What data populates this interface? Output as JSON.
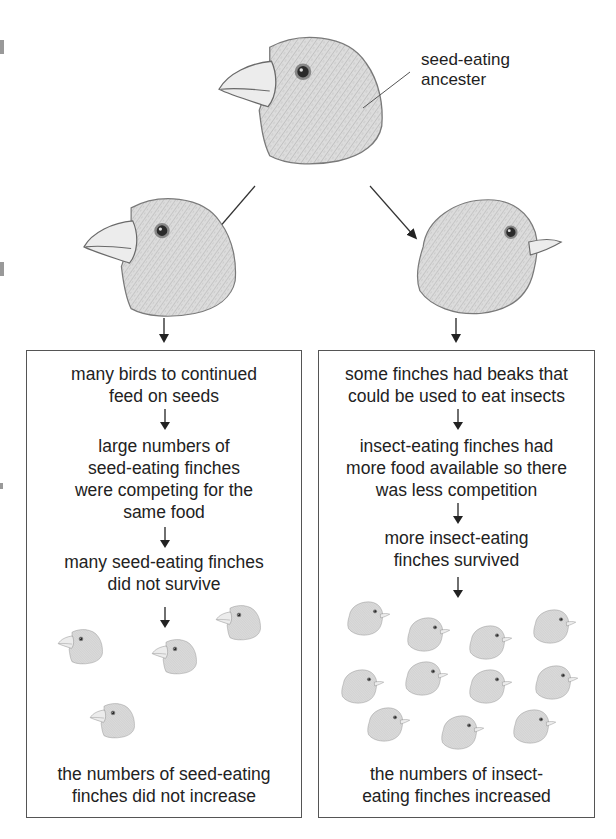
{
  "diagram": {
    "title_label": {
      "line1": "seed-eating",
      "line2": "ancester"
    },
    "ancestor": {
      "name": "seed-eating-ancestor",
      "beak": "thick"
    },
    "branches": [
      {
        "name": "seed-eating-branch",
        "beak": "thick",
        "steps": [
          {
            "lines": [
              "many birds to continued",
              "feed on seeds"
            ]
          },
          {
            "lines": [
              "large numbers of",
              "seed-eating finches",
              "were competing for the",
              "same food"
            ]
          },
          {
            "lines": [
              "many seed-eating finches",
              "did not survive"
            ]
          }
        ],
        "population_count": 4,
        "outcome": {
          "lines": [
            "the numbers of seed-eating",
            "finches did not increase"
          ]
        }
      },
      {
        "name": "insect-eating-branch",
        "beak": "thin",
        "steps": [
          {
            "lines": [
              "some finches had beaks that",
              "could be used to eat insects"
            ]
          },
          {
            "lines": [
              "insect-eating finches had",
              "more food available so there",
              "was less competition"
            ]
          },
          {
            "lines": [
              "more insect-eating",
              "finches survived"
            ]
          }
        ],
        "population_count": 11,
        "outcome": {
          "lines": [
            "the numbers of insect-",
            "eating finches increased"
          ]
        }
      }
    ],
    "colors": {
      "line": "#333333",
      "box_border": "#555555",
      "bird_fill": "#d9d9d9",
      "bird_stroke": "#6e6e6e",
      "beak_fill": "#ececec"
    }
  }
}
